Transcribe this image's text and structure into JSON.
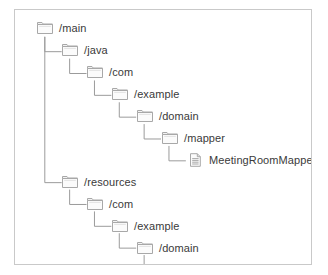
{
  "panel": {
    "border_color": "#c9c9c9",
    "background_color": "#ffffff"
  },
  "tree": {
    "line_color": "#9a9a9a",
    "label_color": "#3a3a3a",
    "folder_icon_name": "folder-icon",
    "file_icon_name": "file-icon",
    "nodes": [
      {
        "label": "/main",
        "type": "folder",
        "depth": 0,
        "x": 22,
        "y": 13
      },
      {
        "label": "/java",
        "type": "folder",
        "depth": 1,
        "x": 47,
        "y": 35
      },
      {
        "label": "/com",
        "type": "folder",
        "depth": 2,
        "x": 72,
        "y": 57
      },
      {
        "label": "/example",
        "type": "folder",
        "depth": 3,
        "x": 97,
        "y": 79
      },
      {
        "label": "/domain",
        "type": "folder",
        "depth": 4,
        "x": 122,
        "y": 101
      },
      {
        "label": "/mapper",
        "type": "folder",
        "depth": 5,
        "x": 147,
        "y": 123
      },
      {
        "label": "MeetingRoomMapper.java",
        "type": "file",
        "depth": 6,
        "x": 172,
        "y": 145
      },
      {
        "label": "/resources",
        "type": "folder",
        "depth": 1,
        "x": 47,
        "y": 167
      },
      {
        "label": "/com",
        "type": "folder",
        "depth": 2,
        "x": 72,
        "y": 189
      },
      {
        "label": "/example",
        "type": "folder",
        "depth": 3,
        "x": 97,
        "y": 211
      },
      {
        "label": "/domain",
        "type": "folder",
        "depth": 4,
        "x": 122,
        "y": 233
      },
      {
        "label": "/mapper",
        "type": "folder",
        "depth": 5,
        "x": 147,
        "y": 255
      },
      {
        "label": "MeetingRoomMapper.xml",
        "type": "file",
        "depth": 6,
        "x": 172,
        "y": 277
      }
    ],
    "connectors": [
      {
        "from": "/main",
        "to": "/java",
        "x": 30,
        "y1": 27,
        "y2": 42,
        "x2": 47
      },
      {
        "from": "/main",
        "to": "/resources",
        "x": 30,
        "y1": 27,
        "y2": 174,
        "x2": 47
      },
      {
        "from": "/java",
        "to": "/com",
        "x": 55,
        "y1": 49,
        "y2": 64,
        "x2": 72
      },
      {
        "from": "/com",
        "to": "/example",
        "x": 80,
        "y1": 71,
        "y2": 86,
        "x2": 97
      },
      {
        "from": "/example",
        "to": "/domain",
        "x": 105,
        "y1": 93,
        "y2": 108,
        "x2": 122
      },
      {
        "from": "/domain",
        "to": "/mapper",
        "x": 130,
        "y1": 115,
        "y2": 130,
        "x2": 147
      },
      {
        "from": "/mapper",
        "to": "MeetingRoomMapper.java",
        "x": 155,
        "y1": 137,
        "y2": 152,
        "x2": 172
      },
      {
        "from": "/resources",
        "to": "/com",
        "x": 55,
        "y1": 181,
        "y2": 196,
        "x2": 72
      },
      {
        "from": "/com",
        "to": "/example",
        "x": 80,
        "y1": 203,
        "y2": 218,
        "x2": 97
      },
      {
        "from": "/example",
        "to": "/domain",
        "x": 105,
        "y1": 225,
        "y2": 240,
        "x2": 122
      },
      {
        "from": "/domain",
        "to": "/mapper",
        "x": 130,
        "y1": 247,
        "y2": 262,
        "x2": 147
      },
      {
        "from": "/mapper",
        "to": "MeetingRoomMapper.xml",
        "x": 155,
        "y1": 269,
        "y2": 284,
        "x2": 172
      }
    ]
  }
}
